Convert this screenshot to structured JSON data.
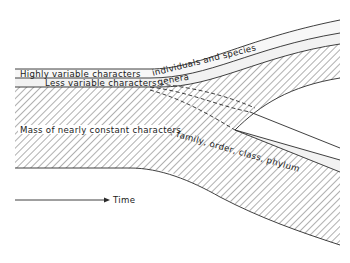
{
  "diagram": {
    "labels": {
      "highly_variable": "Highly variable characters",
      "individuals_species": "individuals and species",
      "less_variable": "Less variable characters:",
      "genera": "genera",
      "mass_constant": "Mass of nearly constant characters",
      "higher_taxa": ": family, order, class, phylum",
      "time": "Time"
    },
    "colors": {
      "line": "#2a2a2a",
      "band_fill": "#f4f4f4",
      "background": "#ffffff"
    }
  }
}
